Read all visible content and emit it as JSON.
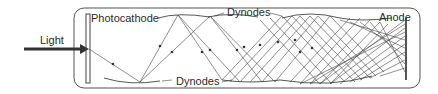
{
  "diagram": {
    "labels": {
      "light": "Light",
      "photocathode": "Photocathode",
      "dynodes_top": "Dynodes",
      "dynodes_bottom": "Dynodes",
      "anode": "Anode"
    },
    "colors": {
      "stroke": "#3a3a3a",
      "text": "#2b2b2b",
      "background": "#ffffff"
    }
  }
}
